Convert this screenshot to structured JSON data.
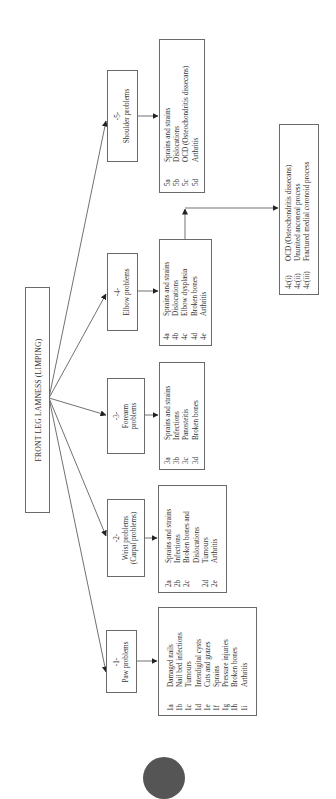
{
  "title": "FRONT LEG LAMNESS (LIMPING)",
  "categories": [
    {
      "id": "5",
      "number": "-5-",
      "label_lines": [
        "Shoulder problems"
      ],
      "items": [
        {
          "code": "5a",
          "text": "Sprains and strains"
        },
        {
          "code": "5b",
          "text": "Dislocations"
        },
        {
          "code": "5c",
          "text": "OCD (Osteochondritis dissecans)"
        },
        {
          "code": "5d",
          "text": "Arthritis"
        }
      ]
    },
    {
      "id": "4",
      "number": "-4-",
      "label_lines": [
        "Elbow problems"
      ],
      "items": [
        {
          "code": "4a",
          "text": "Sprains and strains"
        },
        {
          "code": "4b",
          "text": "Dislocations"
        },
        {
          "code": "4c",
          "text": "Elbow dysplasia"
        },
        {
          "code": "4d",
          "text": "Broken bones"
        },
        {
          "code": "4e",
          "text": "Arthritis"
        }
      ],
      "sub_items": [
        {
          "code": "4c(i)",
          "text": "OCD (Osteochondritis dissecans)"
        },
        {
          "code": "4c(ii)",
          "text": "Ununited anconeal process"
        },
        {
          "code": "4c(iii)",
          "text": "Fractured medial coronoid process"
        }
      ]
    },
    {
      "id": "3",
      "number": "-3-",
      "label_lines": [
        "Forearm",
        "problems"
      ],
      "items": [
        {
          "code": "3a",
          "text": "Sprains and strains"
        },
        {
          "code": "3b",
          "text": "Infections"
        },
        {
          "code": "3c",
          "text": "Panosteitis"
        },
        {
          "code": "3d",
          "text": "Broken bones"
        }
      ]
    },
    {
      "id": "2",
      "number": "-2-",
      "label_lines": [
        "Wrist problems",
        "(Carpal problems)"
      ],
      "items": [
        {
          "code": "2a",
          "text": "Sprains and strains"
        },
        {
          "code": "2b",
          "text": "Infections"
        },
        {
          "code": "2c",
          "text": "Broken bones and"
        },
        {
          "code": "",
          "text": "Dislocations"
        },
        {
          "code": "2d",
          "text": "Tumours"
        },
        {
          "code": "2e",
          "text": "Arthritis"
        }
      ]
    },
    {
      "id": "1",
      "number": "-1-",
      "label_lines": [
        "Paw problems"
      ],
      "items": [
        {
          "code": "1a",
          "text": "Damaged nails"
        },
        {
          "code": "1b",
          "text": "Nail bed infections"
        },
        {
          "code": "1c",
          "text": "Tumours"
        },
        {
          "code": "1d",
          "text": "Interdigital cysts"
        },
        {
          "code": "1e",
          "text": "Cuts and grazes"
        },
        {
          "code": "1f",
          "text": "Sprains"
        },
        {
          "code": "1g",
          "text": "Pressure injuries"
        },
        {
          "code": "1h",
          "text": "Broken bones"
        },
        {
          "code": "1i",
          "text": "Arthritis"
        }
      ]
    }
  ],
  "colors": {
    "line": "#333333",
    "border": "#6a6a6a",
    "text": "#333333",
    "page_marker": "#555555"
  }
}
